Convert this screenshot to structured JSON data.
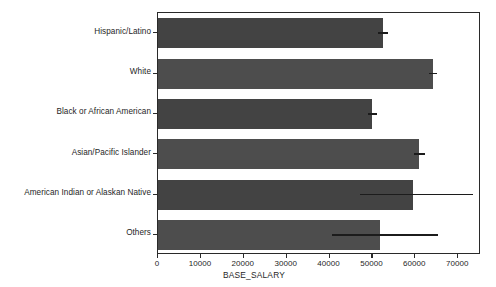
{
  "chart_data": {
    "type": "bar",
    "orientation": "horizontal",
    "title": "",
    "xlabel": "BASE_SALARY",
    "ylabel": "RACE",
    "categories": [
      "Hispanic/Latino",
      "White",
      "Black or African American",
      "Asian/Pacific Islander",
      "American Indian or Alaskan Native",
      "Others"
    ],
    "values": [
      52400,
      64100,
      49900,
      60900,
      59500,
      51800
    ],
    "error_low": [
      51200,
      63200,
      48900,
      59600,
      47000,
      40500
    ],
    "error_high": [
      53700,
      65000,
      51000,
      62200,
      73500,
      65200
    ],
    "xlim": [
      0,
      75300
    ],
    "ylim": [
      0,
      6
    ],
    "xticks": [
      0,
      10000,
      20000,
      30000,
      40000,
      50000,
      60000,
      70000
    ],
    "xtick_labels": [
      "0",
      "10000",
      "20000",
      "30000",
      "40000",
      "50000",
      "60000",
      "70000"
    ],
    "grid": false,
    "legend": null,
    "bar_color": "#434343",
    "bar_color_alt": "#4d4d4d",
    "error_color": "#1c1c1c",
    "axis_color": "#2a2a2a",
    "background": "#ffffff"
  }
}
